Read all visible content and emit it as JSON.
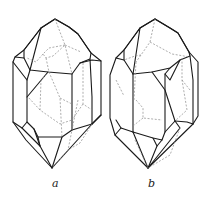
{
  "figure": {
    "crystals": [
      {
        "id": "a",
        "label": "a"
      },
      {
        "id": "b",
        "label": "b"
      }
    ],
    "colors": {
      "visible_edges": "#1a1a1a",
      "hidden_edges": "#8a8a8a",
      "background": "#ffffff"
    }
  }
}
